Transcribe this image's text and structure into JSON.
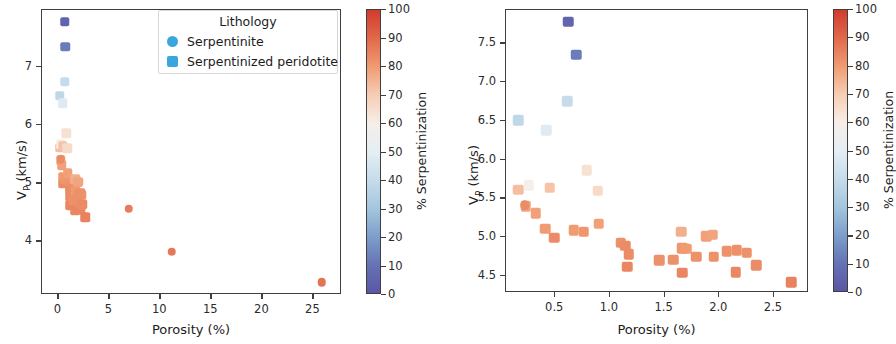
{
  "figure": {
    "colormap": "RdBu_r",
    "marker_shapes": {
      "Serpentinite": "circle",
      "Serpentinized peridotite": "square"
    }
  },
  "legend": {
    "title": "Lithology",
    "entries": [
      {
        "label": "Serpentinite",
        "shape": "circle",
        "color": "#3ba5e0"
      },
      {
        "label": "Serpentinized peridotite",
        "shape": "square",
        "color": "#3ba5e0"
      }
    ]
  },
  "colorbar": {
    "title": "% Serpentinization",
    "min": 0,
    "max": 100,
    "ticks": [
      0,
      10,
      20,
      30,
      40,
      50,
      60,
      70,
      80,
      90,
      100
    ],
    "stops": [
      {
        "v": 0,
        "color": "#5a56a5"
      },
      {
        "v": 10,
        "color": "#6573b4"
      },
      {
        "v": 20,
        "color": "#7d9fcb"
      },
      {
        "v": 30,
        "color": "#a4c6dd"
      },
      {
        "v": 40,
        "color": "#c6dcec"
      },
      {
        "v": 50,
        "color": "#e5eef4"
      },
      {
        "v": 60,
        "color": "#f7eee7"
      },
      {
        "v": 70,
        "color": "#f7cdb4"
      },
      {
        "v": 80,
        "color": "#f09b72"
      },
      {
        "v": 90,
        "color": "#e1694a"
      },
      {
        "v": 100,
        "color": "#d13b2e"
      }
    ]
  },
  "chart_data": [
    {
      "type": "scatter",
      "panel": "left",
      "title": "",
      "xlabel": "Porosity (%)",
      "ylabel": "V_P (km/s)",
      "ylabel_base": "V",
      "ylabel_sub": "P",
      "ylabel_rest": " (km/s)",
      "xlim": [
        -1.6,
        27.8
      ],
      "ylim": [
        3.08,
        7.98
      ],
      "xticks": [
        0,
        5,
        10,
        15,
        20,
        25
      ],
      "yticks": [
        4,
        5,
        6,
        7
      ],
      "grid": false,
      "colorbar_label": "% Serpentinization",
      "series": [
        {
          "name": "Serpentinized peridotite",
          "shape": "square",
          "points": [
            {
              "x": 0.62,
              "y": 7.78,
              "c": 5
            },
            {
              "x": 0.69,
              "y": 7.35,
              "c": 12
            },
            {
              "x": 0.61,
              "y": 6.75,
              "c": 40
            },
            {
              "x": 0.16,
              "y": 6.51,
              "c": 38
            },
            {
              "x": 0.42,
              "y": 6.38,
              "c": 48
            },
            {
              "x": 0.79,
              "y": 5.86,
              "c": 64
            },
            {
              "x": 0.16,
              "y": 5.61,
              "c": 73
            },
            {
              "x": 0.26,
              "y": 5.67,
              "c": 60
            },
            {
              "x": 0.45,
              "y": 5.64,
              "c": 72
            },
            {
              "x": 0.89,
              "y": 5.6,
              "c": 66
            },
            {
              "x": 0.23,
              "y": 5.4,
              "c": 78
            },
            {
              "x": 0.32,
              "y": 5.31,
              "c": 79
            },
            {
              "x": 0.41,
              "y": 5.11,
              "c": 80
            },
            {
              "x": 0.49,
              "y": 4.99,
              "c": 83
            },
            {
              "x": 0.67,
              "y": 5.09,
              "c": 80
            },
            {
              "x": 0.76,
              "y": 5.07,
              "c": 81
            },
            {
              "x": 0.9,
              "y": 5.17,
              "c": 79
            },
            {
              "x": 1.1,
              "y": 4.93,
              "c": 82
            },
            {
              "x": 1.14,
              "y": 4.89,
              "c": 83
            },
            {
              "x": 1.17,
              "y": 4.78,
              "c": 83
            },
            {
              "x": 1.16,
              "y": 4.62,
              "c": 84
            },
            {
              "x": 1.45,
              "y": 4.7,
              "c": 82
            },
            {
              "x": 1.58,
              "y": 4.71,
              "c": 82
            },
            {
              "x": 1.65,
              "y": 5.07,
              "c": 76
            },
            {
              "x": 1.66,
              "y": 4.86,
              "c": 81
            },
            {
              "x": 1.7,
              "y": 4.85,
              "c": 80
            },
            {
              "x": 1.66,
              "y": 4.54,
              "c": 84
            },
            {
              "x": 1.79,
              "y": 4.75,
              "c": 82
            },
            {
              "x": 1.88,
              "y": 5.01,
              "c": 79
            },
            {
              "x": 1.94,
              "y": 5.03,
              "c": 78
            },
            {
              "x": 1.95,
              "y": 4.75,
              "c": 82
            },
            {
              "x": 2.07,
              "y": 4.82,
              "c": 82
            },
            {
              "x": 2.16,
              "y": 4.83,
              "c": 82
            },
            {
              "x": 2.15,
              "y": 4.55,
              "c": 84
            },
            {
              "x": 2.25,
              "y": 4.8,
              "c": 82
            },
            {
              "x": 2.34,
              "y": 4.64,
              "c": 83
            },
            {
              "x": 2.66,
              "y": 4.42,
              "c": 85
            }
          ]
        },
        {
          "name": "Serpentinite",
          "shape": "circle",
          "points": [
            {
              "x": 0.22,
              "y": 5.41,
              "c": 83
            },
            {
              "x": 6.9,
              "y": 4.56,
              "c": 86
            },
            {
              "x": 11.1,
              "y": 3.82,
              "c": 87
            },
            {
              "x": 25.8,
              "y": 3.3,
              "c": 88
            }
          ]
        }
      ]
    },
    {
      "type": "scatter",
      "panel": "right",
      "title": "",
      "xlabel": "Porosity (%)",
      "ylabel": "V_P (km/s)",
      "ylabel_base": "V",
      "ylabel_sub": "P",
      "ylabel_rest": " (km/s)",
      "xlim": [
        0.05,
        2.82
      ],
      "ylim": [
        4.28,
        7.93
      ],
      "xticks": [
        0.5,
        1.0,
        1.5,
        2.0,
        2.5
      ],
      "xticklabels": [
        "0.5",
        "1.0",
        "1.5",
        "2.0",
        "2.5"
      ],
      "yticks": [
        4.5,
        5.0,
        5.5,
        6.0,
        6.5,
        7.0,
        7.5
      ],
      "yticklabels": [
        "4.5",
        "5.0",
        "5.5",
        "6.0",
        "6.5",
        "7.0",
        "7.5"
      ],
      "grid": false,
      "colorbar_label": "% Serpentinization",
      "series": [
        {
          "name": "Serpentinized peridotite",
          "shape": "square",
          "points": [
            {
              "x": 0.62,
              "y": 7.78,
              "c": 5
            },
            {
              "x": 0.69,
              "y": 7.35,
              "c": 12
            },
            {
              "x": 0.61,
              "y": 6.75,
              "c": 40
            },
            {
              "x": 0.16,
              "y": 6.51,
              "c": 38
            },
            {
              "x": 0.42,
              "y": 6.38,
              "c": 48
            },
            {
              "x": 0.79,
              "y": 5.86,
              "c": 64
            },
            {
              "x": 0.16,
              "y": 5.61,
              "c": 73
            },
            {
              "x": 0.26,
              "y": 5.67,
              "c": 60
            },
            {
              "x": 0.45,
              "y": 5.64,
              "c": 72
            },
            {
              "x": 0.89,
              "y": 5.6,
              "c": 66
            },
            {
              "x": 0.23,
              "y": 5.4,
              "c": 78
            },
            {
              "x": 0.32,
              "y": 5.31,
              "c": 79
            },
            {
              "x": 0.41,
              "y": 5.11,
              "c": 80
            },
            {
              "x": 0.49,
              "y": 4.99,
              "c": 83
            },
            {
              "x": 0.67,
              "y": 5.09,
              "c": 80
            },
            {
              "x": 0.76,
              "y": 5.07,
              "c": 81
            },
            {
              "x": 0.9,
              "y": 5.17,
              "c": 79
            },
            {
              "x": 1.1,
              "y": 4.93,
              "c": 82
            },
            {
              "x": 1.14,
              "y": 4.89,
              "c": 83
            },
            {
              "x": 1.17,
              "y": 4.78,
              "c": 83
            },
            {
              "x": 1.16,
              "y": 4.62,
              "c": 84
            },
            {
              "x": 1.45,
              "y": 4.7,
              "c": 82
            },
            {
              "x": 1.58,
              "y": 4.71,
              "c": 82
            },
            {
              "x": 1.65,
              "y": 5.07,
              "c": 76
            },
            {
              "x": 1.66,
              "y": 4.86,
              "c": 81
            },
            {
              "x": 1.7,
              "y": 4.85,
              "c": 80
            },
            {
              "x": 1.66,
              "y": 4.54,
              "c": 84
            },
            {
              "x": 1.79,
              "y": 4.75,
              "c": 82
            },
            {
              "x": 1.88,
              "y": 5.01,
              "c": 79
            },
            {
              "x": 1.94,
              "y": 5.03,
              "c": 78
            },
            {
              "x": 1.95,
              "y": 4.75,
              "c": 82
            },
            {
              "x": 2.07,
              "y": 4.82,
              "c": 82
            },
            {
              "x": 2.16,
              "y": 4.83,
              "c": 82
            },
            {
              "x": 2.15,
              "y": 4.55,
              "c": 84
            },
            {
              "x": 2.25,
              "y": 4.8,
              "c": 82
            },
            {
              "x": 2.34,
              "y": 4.64,
              "c": 83
            },
            {
              "x": 2.66,
              "y": 4.42,
              "c": 85
            }
          ]
        },
        {
          "name": "Serpentinite",
          "shape": "circle",
          "points": [
            {
              "x": 0.22,
              "y": 5.41,
              "c": 83
            }
          ]
        }
      ]
    }
  ]
}
